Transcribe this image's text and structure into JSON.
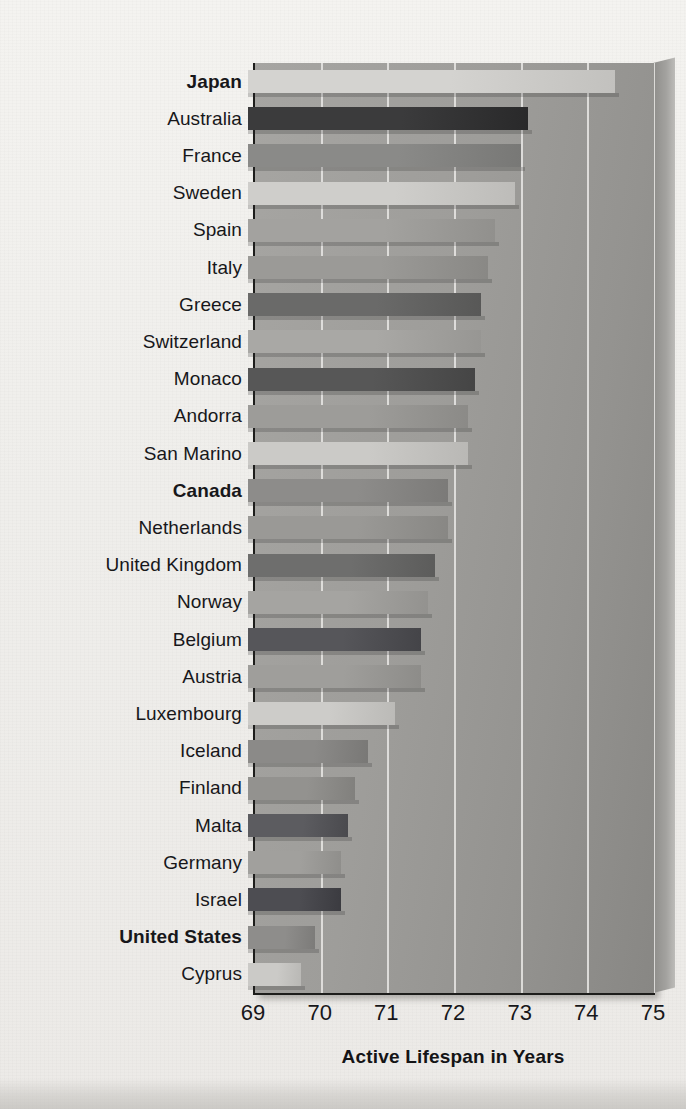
{
  "chart_data": {
    "type": "bar",
    "orientation": "horizontal",
    "title": "",
    "xlabel": "Active Lifespan in Years",
    "ylabel": "",
    "xlim": [
      69,
      75
    ],
    "xticks": [
      69,
      70,
      71,
      72,
      73,
      74,
      75
    ],
    "xtick_labels": [
      "69",
      "70",
      "71",
      "72",
      "73",
      "74",
      "75"
    ],
    "grid": "vertical",
    "legend": "none",
    "categories": [
      "Japan",
      "Australia",
      "France",
      "Sweden",
      "Spain",
      "Italy",
      "Greece",
      "Switzerland",
      "Monaco",
      "Andorra",
      "San Marino",
      "Canada",
      "Netherlands",
      "United Kingdom",
      "Norway",
      "Belgium",
      "Austria",
      "Luxembourg",
      "Iceland",
      "Finland",
      "Malta",
      "Germany",
      "Israel",
      "United States",
      "Cyprus"
    ],
    "values": [
      74.5,
      73.2,
      73.1,
      73.0,
      72.7,
      72.6,
      72.5,
      72.5,
      72.4,
      72.3,
      72.3,
      72.0,
      72.0,
      71.8,
      71.7,
      71.6,
      71.6,
      71.2,
      70.8,
      70.6,
      70.5,
      70.4,
      70.4,
      70.0,
      69.8
    ],
    "highlighted": [
      "Japan",
      "Canada",
      "United States"
    ],
    "bar_shades": [
      "#d4d3d0",
      "#3b3b3c",
      "#8a8a88",
      "#cfcecb",
      "#a3a29f",
      "#9b9a97",
      "#6a6a69",
      "#a9a8a5",
      "#575757",
      "#9d9c99",
      "#cbcac7",
      "#8d8c8a",
      "#9a9996",
      "#6e6e6d",
      "#a5a4a1",
      "#56565a",
      "#9f9e9b",
      "#cdccc9",
      "#8b8a88",
      "#93928f",
      "#5c5c60",
      "#a1a09d",
      "#4d4d52",
      "#8e8d8b",
      "#cbcac7"
    ]
  },
  "axis": {
    "x_title": "Active Lifespan in Years"
  }
}
